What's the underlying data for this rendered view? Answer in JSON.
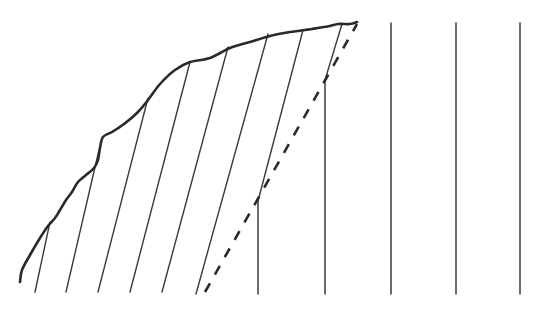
{
  "diagram": {
    "colors": {
      "background": "#ffffff",
      "stroke": "#2a2a2a",
      "thin_stroke": "#3a3a3a"
    },
    "curve": {
      "points": [
        [
          20,
          282
        ],
        [
          22,
          270
        ],
        [
          30,
          255
        ],
        [
          40,
          238
        ],
        [
          48,
          226
        ],
        [
          55,
          218
        ],
        [
          60,
          210
        ],
        [
          66,
          200
        ],
        [
          72,
          192
        ],
        [
          78,
          182
        ],
        [
          86,
          175
        ],
        [
          94,
          168
        ],
        [
          98,
          160
        ],
        [
          100,
          148
        ],
        [
          103,
          137
        ],
        [
          112,
          132
        ],
        [
          124,
          124
        ],
        [
          138,
          112
        ],
        [
          148,
          100
        ],
        [
          160,
          84
        ],
        [
          175,
          70
        ],
        [
          190,
          62
        ],
        [
          210,
          58
        ],
        [
          230,
          48
        ],
        [
          250,
          42
        ],
        [
          270,
          36
        ],
        [
          290,
          32
        ],
        [
          305,
          30
        ],
        [
          318,
          28
        ],
        [
          330,
          26
        ],
        [
          338,
          24
        ],
        [
          350,
          24
        ],
        [
          357,
          22
        ]
      ],
      "stroke_width": 2.6
    },
    "slanted_lines": [
      {
        "top": [
          50,
          222
        ],
        "bottom": [
          35,
          292
        ]
      },
      {
        "top": [
          99,
          150
        ],
        "bottom": [
          66,
          292
        ]
      },
      {
        "top": [
          148,
          98
        ],
        "bottom": [
          98,
          292
        ]
      },
      {
        "top": [
          190,
          62
        ],
        "bottom": [
          130,
          292
        ]
      },
      {
        "top": [
          228,
          47
        ],
        "bottom": [
          162,
          292
        ]
      },
      {
        "top": [
          268,
          34
        ],
        "bottom": [
          196,
          294
        ]
      },
      {
        "top": [
          303,
          30
        ],
        "bottom": [
          258,
          201
        ]
      },
      {
        "top": [
          342,
          24
        ],
        "bottom": [
          325,
          80
        ]
      }
    ],
    "vertical_lines": [
      {
        "x": 258,
        "top": 201,
        "bottom": 294
      },
      {
        "x": 325,
        "top": 80,
        "bottom": 294
      },
      {
        "x": 391,
        "top": 23,
        "bottom": 294
      },
      {
        "x": 456,
        "top": 23,
        "bottom": 294
      },
      {
        "x": 520,
        "top": 23,
        "bottom": 294
      }
    ],
    "dashed_line": {
      "from": [
        205,
        292
      ],
      "to": [
        357,
        24
      ],
      "dash": "10 10",
      "stroke_width": 2.6
    }
  }
}
